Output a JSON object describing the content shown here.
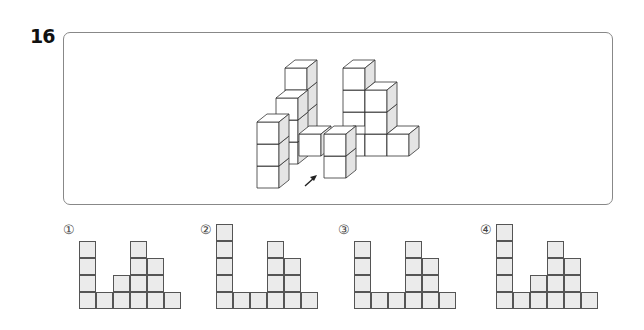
{
  "question": {
    "number": "16"
  },
  "figure": {
    "arrow_icon": "arrow-up-right"
  },
  "options": [
    {
      "label": "①",
      "column_heights": [
        4,
        1,
        2,
        4,
        3,
        1
      ]
    },
    {
      "label": "②",
      "column_heights": [
        5,
        1,
        1,
        4,
        3,
        1
      ]
    },
    {
      "label": "③",
      "column_heights": [
        4,
        1,
        1,
        4,
        3,
        1
      ]
    },
    {
      "label": "④",
      "column_heights": [
        5,
        1,
        2,
        4,
        3,
        1
      ]
    }
  ],
  "colors": {
    "cell_fill": "#ebebeb",
    "cell_border": "#555555",
    "box_border": "#888888"
  }
}
